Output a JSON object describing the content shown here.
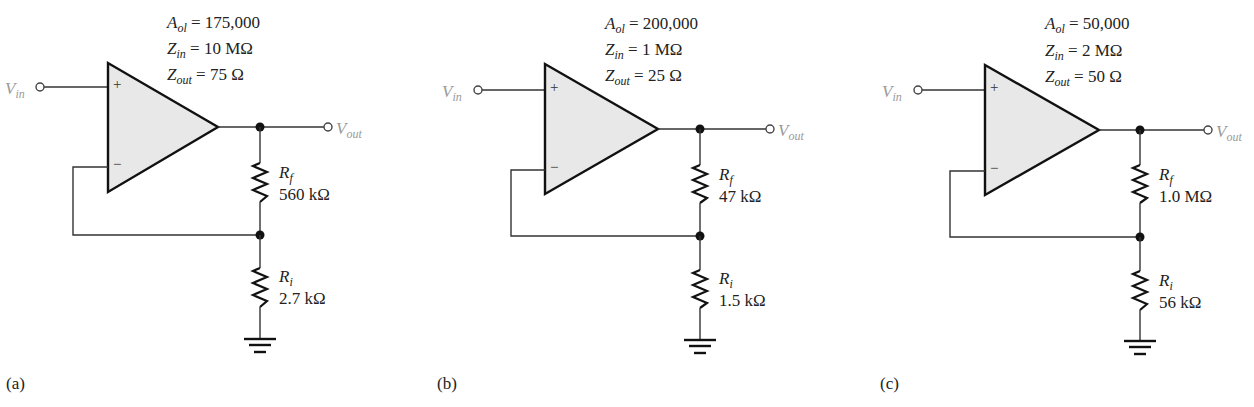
{
  "figure": {
    "circuits": [
      {
        "caption": "(a)",
        "params": {
          "aol_sym": "A",
          "aol_sub": "ol",
          "aol_value": "= 175,000",
          "zin_sym": "Z",
          "zin_sub": "in",
          "zin_value": "= 10 MΩ",
          "zout_sym": "Z",
          "zout_sub": "out",
          "zout_value": "= 75 Ω"
        },
        "vin": {
          "sym": "V",
          "sub": "in"
        },
        "vout": {
          "sym": "V",
          "sub": "out"
        },
        "plus": "+",
        "minus": "−",
        "rf": {
          "sym": "R",
          "sub": "f",
          "value": "560 kΩ"
        },
        "ri": {
          "sym": "R",
          "sub": "i",
          "value": "2.7 kΩ"
        }
      },
      {
        "caption": "(b)",
        "params": {
          "aol_sym": "A",
          "aol_sub": "ol",
          "aol_value": "= 200,000",
          "zin_sym": "Z",
          "zin_sub": "in",
          "zin_value": "= 1 MΩ",
          "zout_sym": "Z",
          "zout_sub": "out",
          "zout_value": "= 25 Ω"
        },
        "vin": {
          "sym": "V",
          "sub": "in"
        },
        "vout": {
          "sym": "V",
          "sub": "out"
        },
        "plus": "+",
        "minus": "−",
        "rf": {
          "sym": "R",
          "sub": "f",
          "value": "47 kΩ"
        },
        "ri": {
          "sym": "R",
          "sub": "i",
          "value": "1.5 kΩ"
        }
      },
      {
        "caption": "(c)",
        "params": {
          "aol_sym": "A",
          "aol_sub": "ol",
          "aol_value": "= 50,000",
          "zin_sym": "Z",
          "zin_sub": "in",
          "zin_value": "= 2 MΩ",
          "zout_sym": "Z",
          "zout_sub": "out",
          "zout_value": "= 50 Ω"
        },
        "vin": {
          "sym": "V",
          "sub": "in"
        },
        "vout": {
          "sym": "V",
          "sub": "out"
        },
        "plus": "+",
        "minus": "−",
        "rf": {
          "sym": "R",
          "sub": "f",
          "value": "1.0 MΩ"
        },
        "ri": {
          "sym": "R",
          "sub": "i",
          "value": "56 kΩ"
        }
      }
    ],
    "colors": {
      "opamp_fill": "#e8e8e8",
      "line": "#111111",
      "terminal_label": "#9a9a9a"
    }
  }
}
